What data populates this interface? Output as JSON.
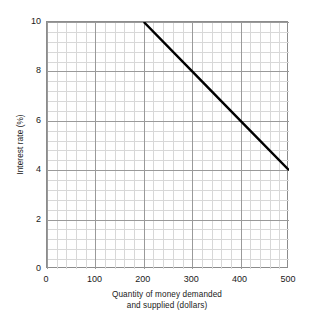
{
  "chart_data": {
    "type": "line",
    "title": "",
    "xlabel_lines": [
      "Quantity of money demanded",
      "and supplied (dollars)"
    ],
    "xlabel": "Quantity of money demanded and supplied (dollars)",
    "ylabel": "Interest rate (%)",
    "xlim": [
      0,
      500
    ],
    "ylim": [
      0,
      10
    ],
    "xticks": [
      0,
      100,
      200,
      300,
      400,
      500
    ],
    "xtick_labels": [
      "0",
      "100",
      "200",
      "300",
      "400",
      "500"
    ],
    "yticks": [
      0,
      2,
      4,
      6,
      8,
      10
    ],
    "ytick_labels": [
      "0",
      "2",
      "4",
      "6",
      "8",
      "10"
    ],
    "x_major_step": 100,
    "y_major_step": 2,
    "x_minor_divisions_per_major": 5,
    "y_minor_divisions_per_major": 5,
    "grid": true,
    "legend": "none",
    "series": [
      {
        "name": "Money demand",
        "x": [
          200,
          300,
          400,
          500
        ],
        "y": [
          10,
          8,
          6,
          4
        ],
        "color": "#000000",
        "line_width": 2.4
      }
    ],
    "annotations": [],
    "colors": {
      "background": "#ffffff",
      "axis": "#8c8c8c",
      "major_grid": "#9a9a9a",
      "minor_grid": "#d8d8d8",
      "text": "#1a1a1a",
      "curve": "#000000"
    }
  }
}
